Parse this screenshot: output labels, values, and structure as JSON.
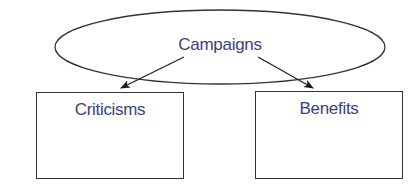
{
  "diagram": {
    "type": "concept-map",
    "colors": {
      "text": "#3d4080",
      "stroke": "#333333",
      "background": "#ffffff"
    },
    "root": {
      "shape": "ellipse",
      "label": "Campaigns"
    },
    "children": [
      {
        "shape": "rectangle",
        "label": "Criticisms"
      },
      {
        "shape": "rectangle",
        "label": "Benefits"
      }
    ],
    "edges": [
      {
        "from": "Campaigns",
        "to": "Criticisms",
        "arrow": "end"
      },
      {
        "from": "Campaigns",
        "to": "Benefits",
        "arrow": "end"
      }
    ]
  }
}
